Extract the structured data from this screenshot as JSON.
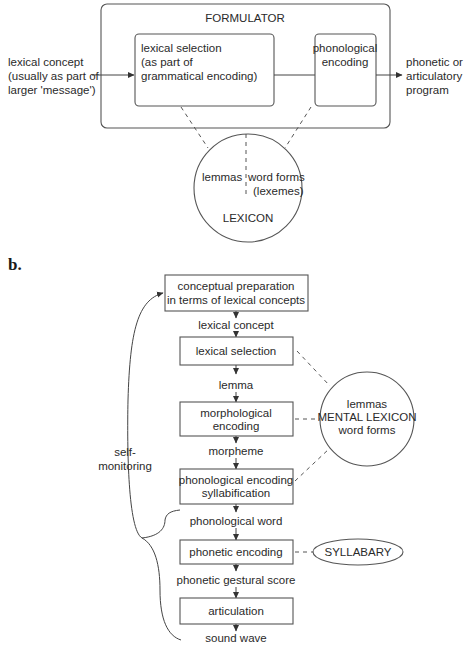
{
  "panel_a": {
    "formulator": {
      "title": "FORMULATOR"
    },
    "input_text": [
      "lexical concept",
      "(usually as part of",
      "larger 'message')"
    ],
    "lexical_selection": [
      "lexical selection",
      "(as part of",
      "grammatical encoding)"
    ],
    "phonological_encoding": [
      "phonological",
      "encoding"
    ],
    "output_text": [
      "phonetic or",
      "articulatory",
      "program"
    ],
    "lexicon": {
      "left": "lemmas",
      "right": [
        "word forms",
        "(lexemes)"
      ],
      "title": "LEXICON"
    }
  },
  "panel_b": {
    "label": "b.",
    "stages": [
      {
        "box": [
          "conceptual preparation",
          "in terms of lexical concepts"
        ],
        "output": "lexical concept"
      },
      {
        "box": [
          "lexical selection"
        ],
        "output": "lemma"
      },
      {
        "box": [
          "morphological",
          "encoding"
        ],
        "output": "morpheme"
      },
      {
        "box": [
          "phonological encoding",
          "syllabification"
        ],
        "output": "phonological word"
      },
      {
        "box": [
          "phonetic encoding"
        ],
        "output": "phonetic gestural score"
      },
      {
        "box": [
          "articulation"
        ],
        "output": "sound wave"
      }
    ],
    "mental_lexicon": [
      "lemmas",
      "MENTAL LEXICON",
      "word forms"
    ],
    "syllabary": "SYLLABARY",
    "self_monitoring": [
      "self-",
      "monitoring"
    ]
  },
  "colors": {
    "stroke": "#555555",
    "text": "#2a2a2a",
    "background": "#ffffff"
  }
}
